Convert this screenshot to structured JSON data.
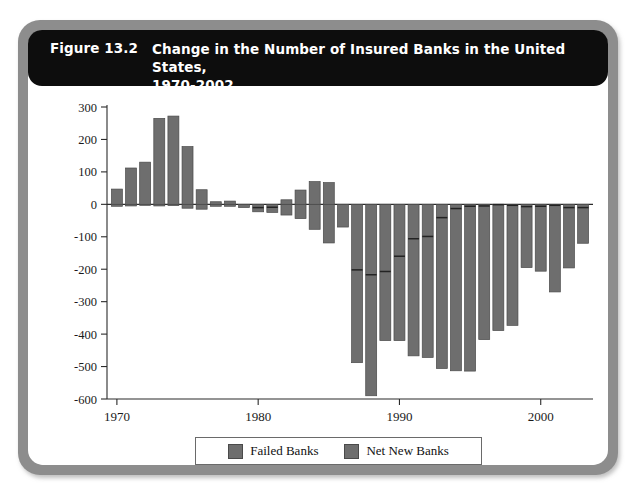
{
  "figure": {
    "number_label": "Figure 13.2",
    "caption_line1": "Change in the Number of Insured Banks in the United States,",
    "caption_line2": "1970-2002",
    "caption_full": "Change in the Number of Insured Banks in the United States, 1970-2002"
  },
  "colors": {
    "frame": "#8d8d8d",
    "title_bar": "#0d0d0d",
    "title_text": "#ffffff",
    "plot_background": "#ffffff",
    "bar_fill": "#6e6e6e",
    "bar_stroke": "#4a4a4a",
    "axis": "#2b2b2b"
  },
  "legend": {
    "position": "bottom-center",
    "entries": [
      {
        "label": "Failed Banks",
        "color": "#6e6e6e"
      },
      {
        "label": "Net New Banks",
        "color": "#6e6e6e"
      }
    ]
  },
  "axes": {
    "y_tick_labels": [
      "300",
      "200",
      "100",
      "0",
      "-100",
      "-200",
      "-300",
      "-400",
      "-500",
      "-600"
    ],
    "x_tick_labels": [
      "1970",
      "1980",
      "1990",
      "2000"
    ]
  },
  "chart_data": {
    "type": "bar",
    "title": "Change in the Number of Insured Banks in the United States, 1970-2002",
    "subtitle": "Figure 13.2",
    "xlabel": "",
    "ylabel": "",
    "grid": false,
    "legend_position": "bottom-center",
    "stacked": true,
    "xlim": [
      1969.3,
      2003.7
    ],
    "ylim": [
      -600,
      300
    ],
    "ytick_values": [
      300,
      200,
      100,
      0,
      -100,
      -200,
      -300,
      -400,
      -500,
      -600
    ],
    "xtick_values": [
      1970,
      1980,
      1990,
      2000
    ],
    "categories": [
      1970,
      1971,
      1972,
      1973,
      1974,
      1975,
      1976,
      1977,
      1978,
      1979,
      1980,
      1981,
      1982,
      1983,
      1984,
      1985,
      1986,
      1987,
      1988,
      1989,
      1990,
      1991,
      1992,
      1993,
      1994,
      1995,
      1996,
      1997,
      1998,
      1999,
      2000,
      2001,
      2002,
      2003
    ],
    "series": [
      {
        "name": "Failed Banks",
        "note": "Upper (less-negative) segment of each stacked bar; drawn from 0 downward",
        "values": [
          -6,
          -5,
          -2,
          -5,
          -4,
          -12,
          -15,
          -6,
          -6,
          -10,
          -10,
          -9,
          -33,
          -44,
          -77,
          -119,
          -143,
          -202,
          -217,
          -207,
          -160,
          -106,
          -99,
          -41,
          -13,
          -6,
          -5,
          -1,
          -3,
          -7,
          -6,
          -3,
          -10,
          -10
        ]
      },
      {
        "name": "Net New Banks",
        "note": "Lower segment; net bank entry/exit added below the Failed Banks segment",
        "values": [
          53,
          117,
          132,
          270,
          276,
          190,
          60,
          14,
          16,
          0,
          -13,
          -16,
          47,
          88,
          147,
          186,
          73,
          -286,
          -373,
          -213,
          -260,
          -361,
          -373,
          -465,
          -500,
          -508,
          -412,
          -388,
          -370,
          -188,
          -200,
          -267,
          -186,
          -110
        ]
      }
    ],
    "bar_totals": [
      47,
      112,
      130,
      265,
      272,
      178,
      45,
      8,
      10,
      -10,
      -23,
      -25,
      14,
      44,
      70,
      67,
      -70,
      -488,
      -590,
      -420,
      -420,
      -467,
      -472,
      -506,
      -513,
      -514,
      -417,
      -389,
      -373,
      -195,
      -206,
      -270,
      -196,
      -120
    ],
    "bar_segments": [
      {
        "year": 1970,
        "failed_end": -6,
        "total_end": 47
      },
      {
        "year": 1971,
        "failed_end": -5,
        "total_end": 112
      },
      {
        "year": 1972,
        "failed_end": -2,
        "total_end": 130
      },
      {
        "year": 1973,
        "failed_end": -5,
        "total_end": 265
      },
      {
        "year": 1974,
        "failed_end": -4,
        "total_end": 272
      },
      {
        "year": 1975,
        "failed_end": -12,
        "total_end": 178
      },
      {
        "year": 1976,
        "failed_end": -15,
        "total_end": 45
      },
      {
        "year": 1977,
        "failed_end": -6,
        "total_end": 8
      },
      {
        "year": 1978,
        "failed_end": -6,
        "total_end": 10
      },
      {
        "year": 1979,
        "failed_end": -10,
        "total_end": -10
      },
      {
        "year": 1980,
        "failed_end": -10,
        "total_end": -23
      },
      {
        "year": 1981,
        "failed_end": -9,
        "total_end": -25
      },
      {
        "year": 1982,
        "failed_end": -33,
        "total_end": 14
      },
      {
        "year": 1983,
        "failed_end": -44,
        "total_end": 44
      },
      {
        "year": 1984,
        "failed_end": -77,
        "total_end": 70
      },
      {
        "year": 1985,
        "failed_end": -119,
        "total_end": 67
      },
      {
        "year": 1986,
        "failed_end": -143,
        "total_end": -70
      },
      {
        "year": 1987,
        "failed_end": -202,
        "total_end": -488
      },
      {
        "year": 1988,
        "failed_end": -217,
        "total_end": -590
      },
      {
        "year": 1989,
        "failed_end": -207,
        "total_end": -420
      },
      {
        "year": 1990,
        "failed_end": -160,
        "total_end": -420
      },
      {
        "year": 1991,
        "failed_end": -106,
        "total_end": -467
      },
      {
        "year": 1992,
        "failed_end": -99,
        "total_end": -472
      },
      {
        "year": 1993,
        "failed_end": -41,
        "total_end": -506
      },
      {
        "year": 1994,
        "failed_end": -13,
        "total_end": -513
      },
      {
        "year": 1995,
        "failed_end": -6,
        "total_end": -514
      },
      {
        "year": 1996,
        "failed_end": -5,
        "total_end": -417
      },
      {
        "year": 1997,
        "failed_end": -1,
        "total_end": -389
      },
      {
        "year": 1998,
        "failed_end": -3,
        "total_end": -373
      },
      {
        "year": 1999,
        "failed_end": -7,
        "total_end": -195
      },
      {
        "year": 2000,
        "failed_end": -6,
        "total_end": -206
      },
      {
        "year": 2001,
        "failed_end": -3,
        "total_end": -270
      },
      {
        "year": 2002,
        "failed_end": -10,
        "total_end": -196
      },
      {
        "year": 2003,
        "failed_end": -10,
        "total_end": -120
      }
    ]
  }
}
